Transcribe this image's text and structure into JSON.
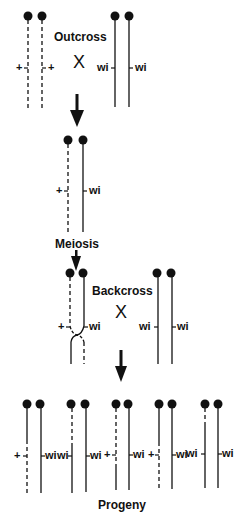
{
  "diagram": {
    "labels": {
      "outcross": "Outcross",
      "cross_symbol": "X",
      "meiosis": "Meiosis",
      "backcross": "Backcross",
      "progeny": "Progeny"
    },
    "alleles": {
      "wild_type": "+",
      "mutant": "wi"
    },
    "legend": {
      "dashed_line": "wild-type (+) chromosome",
      "solid_line": "wi chromosome"
    },
    "stages": [
      {
        "name": "Outcross parents",
        "left_pair": [
          "+",
          "+"
        ],
        "right_pair": [
          "wi",
          "wi"
        ]
      },
      {
        "name": "F1 heterozygote",
        "pair": [
          "+",
          "wi"
        ]
      },
      {
        "name": "Backcross",
        "left_pair": [
          "+",
          "wi"
        ],
        "right_pair": [
          "wi",
          "wi"
        ],
        "note": "crossover between chromatids below marker"
      },
      {
        "name": "Progeny",
        "individuals": [
          {
            "genotype": [
              "+",
              "wi"
            ],
            "left_pattern": "solid-top / dashed-bottom"
          },
          {
            "genotype": [
              "wi",
              "wi"
            ],
            "left_pattern": "dashed-top / solid-bottom"
          },
          {
            "genotype": [
              "+",
              "wi"
            ],
            "left_pattern": "dashed-top / solid-bottom"
          },
          {
            "genotype": [
              "+",
              "wi"
            ],
            "left_pattern": "solid-top / dashed-bottom"
          },
          {
            "genotype": [
              "wi",
              "wi"
            ],
            "left_pattern": "dashed-short-top / solid"
          }
        ]
      }
    ],
    "colors": {
      "ink": "#111111",
      "background": "#ffffff"
    }
  }
}
